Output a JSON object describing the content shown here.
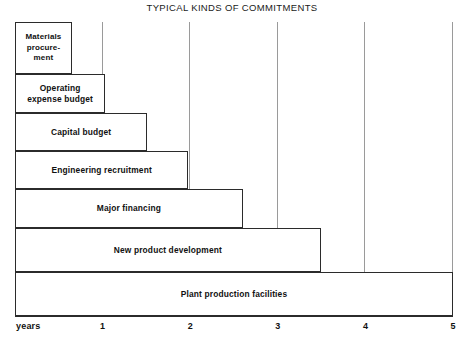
{
  "chart_data": {
    "type": "bar",
    "orientation": "horizontal",
    "title": "TYPICAL KINDS OF COMMITMENTS",
    "xlabel": "years",
    "ylabel": "",
    "xlim": [
      0,
      5
    ],
    "grid": true,
    "legend": null,
    "xticks": [
      "1",
      "2",
      "3",
      "4",
      "5"
    ],
    "xtick_values": [
      1,
      2,
      3,
      4,
      5
    ],
    "categories": [
      "Materials\nprocure-\nment",
      "Operating\nexpense budget",
      "Capital budget",
      "Engineering recruitment",
      "Major financing",
      "New product development",
      "Plant production facilities"
    ],
    "values": [
      0.65,
      1.03,
      1.51,
      1.98,
      2.6,
      3.49,
      5.0
    ],
    "bars": [
      {
        "label": "Materials\nprocure-\nment",
        "value": 0.65,
        "top": 0,
        "height": 52
      },
      {
        "label": "Operating\nexpense budget",
        "value": 1.03,
        "top": 52,
        "height": 39
      },
      {
        "label": "Capital budget",
        "value": 1.51,
        "top": 91,
        "height": 38
      },
      {
        "label": "Engineering recruitment",
        "value": 1.98,
        "top": 129,
        "height": 38
      },
      {
        "label": "Major financing",
        "value": 2.6,
        "top": 167,
        "height": 39
      },
      {
        "label": "New product development",
        "value": 3.49,
        "top": 206,
        "height": 44
      },
      {
        "label": "Plant production facilities",
        "value": 5.0,
        "top": 250,
        "height": 44
      }
    ]
  },
  "axis": {
    "name_label": "years",
    "ticks": [
      {
        "label": "1",
        "value": 1
      },
      {
        "label": "2",
        "value": 2
      },
      {
        "label": "3",
        "value": 3
      },
      {
        "label": "4",
        "value": 4
      },
      {
        "label": "5",
        "value": 5
      }
    ]
  },
  "colors": {
    "bar_border": "#2b2b2b",
    "bar_fill": "#ffffff",
    "gridline": "#9a9a9a",
    "axis": "#2b2b2b",
    "text": "#111111",
    "background": "#ffffff"
  }
}
